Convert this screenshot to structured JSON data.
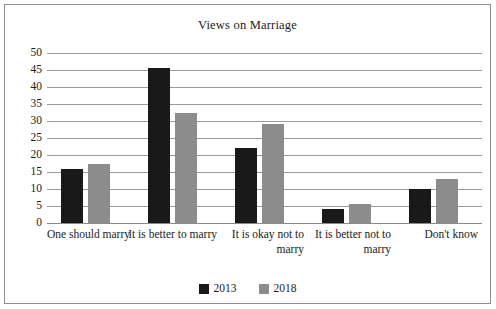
{
  "chart_data": {
    "type": "bar",
    "title": "Views on Marriage",
    "xlabel": "",
    "ylabel": "",
    "ylim": [
      0,
      50
    ],
    "ytick_step": 5,
    "yticks": [
      "50",
      "45",
      "40",
      "35",
      "30",
      "25",
      "20",
      "15",
      "10",
      "5",
      "0"
    ],
    "grid": true,
    "legend_position": "bottom",
    "categories": [
      "One should marry",
      "It is better to marry",
      "It is okay not to marry",
      "It is better not to marry",
      "Don't know"
    ],
    "series": [
      {
        "name": "2013",
        "color": "#191919",
        "values": [
          16,
          45.5,
          22,
          4,
          10
        ]
      },
      {
        "name": "2018",
        "color": "#8c8c8c",
        "values": [
          17.5,
          32.5,
          29,
          5.5,
          13
        ]
      }
    ]
  },
  "frame": {
    "border_color": "#8e8e8e",
    "background": "#ffffff"
  }
}
